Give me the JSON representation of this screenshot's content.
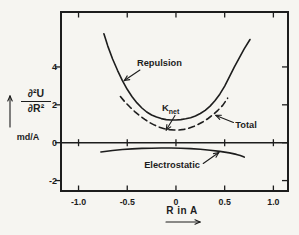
{
  "figure": {
    "bg": "#f6f5f1",
    "ink": "#1d1d1d"
  },
  "y_axis": {
    "numerator": "∂²U",
    "denominator": "∂R²",
    "unit": "md/A",
    "ticks": [
      {
        "label": "4",
        "value": 4
      },
      {
        "label": "2",
        "value": 2
      },
      {
        "label": "0",
        "value": 0
      },
      {
        "label": "-2",
        "value": -2
      }
    ]
  },
  "x_axis": {
    "label": "R in A",
    "ticks": [
      {
        "label": "-1.0",
        "value": -1.0
      },
      {
        "label": "-0.5",
        "value": -0.5
      },
      {
        "label": "0",
        "value": 0
      },
      {
        "label": "0.5",
        "value": 0.5
      },
      {
        "label": "1.0",
        "value": 1.0
      }
    ]
  },
  "chart_data": {
    "type": "line",
    "title": "",
    "xlabel": "R in A",
    "ylabel": "∂²U/∂R² (md/A)",
    "xlim": [
      -1.18,
      1.15
    ],
    "ylim": [
      -2.55,
      6.9
    ],
    "x_ticks": [
      -1.0,
      -0.5,
      0,
      0.5,
      1.0
    ],
    "y_ticks": [
      4,
      2,
      0,
      -2
    ],
    "zero_line": true,
    "grid": false,
    "series": [
      {
        "name": "Repulsion",
        "style": "solid",
        "points": [
          [
            -0.74,
            5.75
          ],
          [
            -0.7,
            5.1
          ],
          [
            -0.65,
            4.42
          ],
          [
            -0.6,
            3.82
          ],
          [
            -0.55,
            3.28
          ],
          [
            -0.5,
            2.82
          ],
          [
            -0.45,
            2.43
          ],
          [
            -0.4,
            2.1
          ],
          [
            -0.35,
            1.83
          ],
          [
            -0.3,
            1.62
          ],
          [
            -0.25,
            1.46
          ],
          [
            -0.2,
            1.35
          ],
          [
            -0.15,
            1.27
          ],
          [
            -0.1,
            1.22
          ],
          [
            -0.05,
            1.2
          ],
          [
            0.0,
            1.2
          ],
          [
            0.05,
            1.22
          ],
          [
            0.1,
            1.26
          ],
          [
            0.15,
            1.32
          ],
          [
            0.2,
            1.41
          ],
          [
            0.25,
            1.54
          ],
          [
            0.3,
            1.71
          ],
          [
            0.35,
            1.93
          ],
          [
            0.4,
            2.21
          ],
          [
            0.45,
            2.56
          ],
          [
            0.5,
            2.99
          ],
          [
            0.55,
            3.49
          ],
          [
            0.6,
            4.0
          ],
          [
            0.65,
            4.48
          ],
          [
            0.7,
            4.95
          ],
          [
            0.76,
            5.45
          ]
        ]
      },
      {
        "name": "Total",
        "style": "dashed",
        "points": [
          [
            -0.57,
            2.44
          ],
          [
            -0.52,
            2.13
          ],
          [
            -0.47,
            1.87
          ],
          [
            -0.42,
            1.63
          ],
          [
            -0.37,
            1.42
          ],
          [
            -0.32,
            1.23
          ],
          [
            -0.27,
            1.06
          ],
          [
            -0.22,
            0.93
          ],
          [
            -0.17,
            0.82
          ],
          [
            -0.12,
            0.74
          ],
          [
            -0.07,
            0.69
          ],
          [
            -0.02,
            0.67
          ],
          [
            0.03,
            0.67
          ],
          [
            0.08,
            0.7
          ],
          [
            0.13,
            0.76
          ],
          [
            0.18,
            0.85
          ],
          [
            0.23,
            0.97
          ],
          [
            0.28,
            1.11
          ],
          [
            0.33,
            1.28
          ],
          [
            0.38,
            1.48
          ],
          [
            0.43,
            1.71
          ],
          [
            0.48,
            1.97
          ],
          [
            0.53,
            2.35
          ]
        ]
      },
      {
        "name": "Electrostatic",
        "style": "solid",
        "points": [
          [
            -0.77,
            -0.49
          ],
          [
            -0.65,
            -0.41
          ],
          [
            -0.55,
            -0.36
          ],
          [
            -0.45,
            -0.33
          ],
          [
            -0.35,
            -0.3
          ],
          [
            -0.25,
            -0.29
          ],
          [
            -0.15,
            -0.28
          ],
          [
            -0.05,
            -0.28
          ],
          [
            0.05,
            -0.29
          ],
          [
            0.15,
            -0.31
          ],
          [
            0.25,
            -0.35
          ],
          [
            0.35,
            -0.4
          ],
          [
            0.45,
            -0.46
          ],
          [
            0.55,
            -0.54
          ],
          [
            0.62,
            -0.62
          ],
          [
            0.66,
            -0.68
          ],
          [
            0.7,
            -0.76
          ]
        ]
      }
    ],
    "annotations": [
      {
        "id": "repulsion",
        "text": "Repulsion",
        "cx": -0.17,
        "cy": 4.23,
        "arrow": {
          "x1": -0.37,
          "y1": 3.84,
          "x2": -0.53,
          "y2": 3.28
        }
      },
      {
        "id": "knet",
        "text_main": "K",
        "text_sub": "net",
        "cx": 0.0,
        "cy": 1.86,
        "arrow": {
          "x1": -0.01,
          "y1": 1.44,
          "x2": -0.1,
          "y2": 0.67
        }
      },
      {
        "id": "total",
        "text": "Total",
        "cx": 0.72,
        "cy": 0.93,
        "arrow": {
          "x1": 0.59,
          "y1": 1.07,
          "x2": 0.41,
          "y2": 1.44
        }
      },
      {
        "id": "electrostatic",
        "text": "Electrostatic",
        "cx": -0.04,
        "cy": -1.13,
        "arrow": {
          "x1": 0.28,
          "y1": -1.1,
          "x2": 0.44,
          "y2": -0.52
        }
      }
    ]
  }
}
